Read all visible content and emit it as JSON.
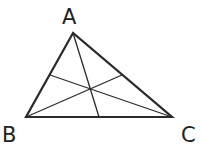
{
  "diagram": {
    "vertices": [
      {
        "label": "A",
        "x": 73,
        "y": 33
      },
      {
        "label": "B",
        "x": 26,
        "y": 117
      },
      {
        "label": "C",
        "x": 172,
        "y": 117
      }
    ],
    "labels": {
      "A": "A",
      "B": "B",
      "C": "C"
    },
    "midpoints": {
      "BC": [
        99,
        117
      ],
      "AC": [
        122,
        75
      ],
      "AB": [
        50,
        75
      ]
    },
    "centroid": [
      90,
      89
    ],
    "stroke_color": "#2a2a2a"
  }
}
